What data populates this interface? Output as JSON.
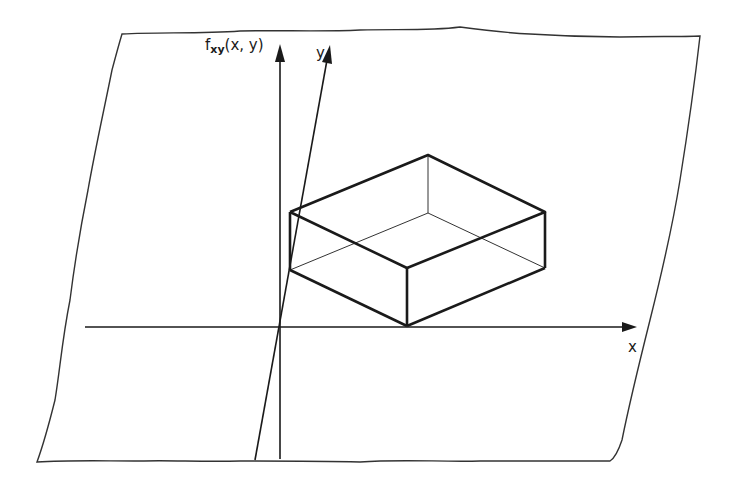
{
  "diagram": {
    "labels": {
      "vertical_axis": {
        "main": "f",
        "subscript": "xy",
        "args": "(x, y)"
      },
      "y_axis": "y",
      "x_axis": "x"
    },
    "colors": {
      "ink": "#1a1a1a",
      "frame": "#333333",
      "background": "#ffffff"
    },
    "elements": [
      "plane-frame",
      "x-axis",
      "y-axis",
      "vertical-axis",
      "box"
    ]
  }
}
